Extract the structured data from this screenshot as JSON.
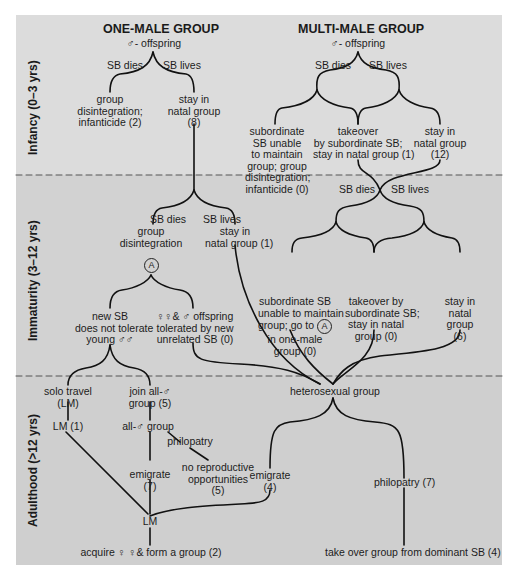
{
  "headers": {
    "one_male": "ONE-MALE GROUP",
    "multi_male": "MULTI-MALE GROUP",
    "one_male_sub": "♂- offspring",
    "multi_male_sub": "♂- offspring"
  },
  "stages": {
    "infancy": "Infancy (0–3 yrs)",
    "immaturity": "Immaturity (3–12 yrs)",
    "adulthood": "Adulthood (>12 yrs)"
  },
  "infancy": {
    "one_male": {
      "sb_dies": "SB dies",
      "sb_lives": "SB lives",
      "disintegration": [
        "group",
        "disintegration;",
        "infanticide (2)"
      ],
      "stay": [
        "stay in",
        "natal group",
        "(8)"
      ]
    },
    "multi_male": {
      "sb_dies": "SB dies",
      "sb_lives": "SB lives",
      "subordinate": [
        "subordinate",
        "SB unable",
        "to maintain",
        "group; group",
        "disintegration;",
        "infanticide (0)"
      ],
      "takeover": [
        "takeover",
        "by subordinate SB;",
        "stay in natal group (1)"
      ],
      "stay": [
        "stay in",
        "natal group",
        "(12)"
      ]
    }
  },
  "immaturity": {
    "one_male": {
      "sb_dies": "SB dies",
      "sb_lives": "SB lives",
      "disintegration": [
        "group",
        "disintegration"
      ],
      "marker_a": "A",
      "stay": [
        "stay in",
        "natal group (1)"
      ],
      "not_tolerate": [
        "new SB",
        "does not tolerate",
        "young ♂♂"
      ],
      "tolerated": [
        "♀♀& ♂ offspring",
        "tolerated by new",
        "unrelated SB (0)"
      ]
    },
    "multi_male": {
      "sb_dies": "SB dies",
      "sb_lives": "SB lives",
      "subordinate": [
        "subordinate SB",
        "unable to maintain",
        "group; go to",
        "in one-male",
        "group (0)"
      ],
      "marker_a": "A",
      "takeover": [
        "takeover by",
        "subordinate SB;",
        "stay in natal",
        "group (0)"
      ],
      "stay": [
        "stay in",
        "natal",
        "group",
        "(6)"
      ]
    }
  },
  "adulthood": {
    "solo_travel": [
      "solo travel",
      "(LM)"
    ],
    "lm1": "LM (1)",
    "join_all_male": [
      "join all-♂",
      "group (5)"
    ],
    "all_male_group": "all-♂ group",
    "philopatry": "philopatry",
    "no_repro": [
      "no reproductive",
      "opportunities",
      "(5)"
    ],
    "emigrate_7": [
      "emigrate",
      "(7)"
    ],
    "lm": "LM",
    "acquire": "acquire ♀ ♀& form a group (2)",
    "heterosexual": "heterosexual group",
    "emigrate_4": [
      "emigrate",
      "(4)"
    ],
    "philopatry_7": "philopatry (7)",
    "take_over": "take over group from dominant SB (4)"
  },
  "colors": {
    "panel_bg": "#dcdcdc",
    "line": "#111111",
    "dash": "#555555"
  }
}
